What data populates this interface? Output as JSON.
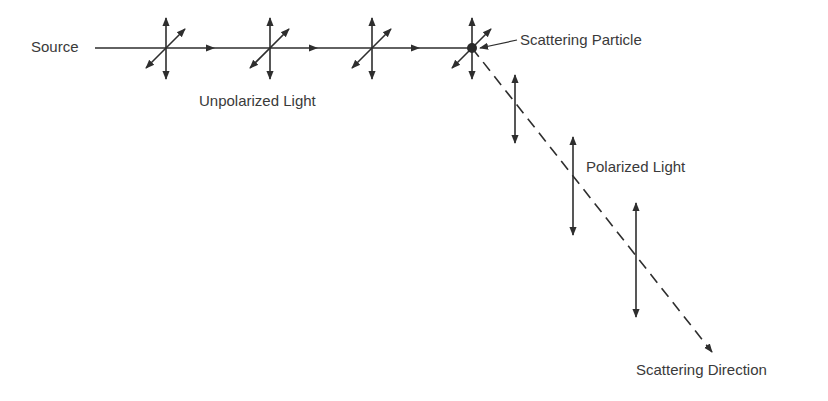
{
  "diagram": {
    "labels": {
      "source": "Source",
      "unpolarized": "Unpolarized Light",
      "particle": "Scattering Particle",
      "polarized": "Polarized Light",
      "direction": "Scattering Direction"
    },
    "colors": {
      "ink": "#2e2e2e",
      "text": "#3a3a3a",
      "background": "#ffffff"
    },
    "beam": {
      "y": 48,
      "x_start": 95,
      "x_end": 472,
      "arrow_x": [
        215,
        318,
        420
      ]
    },
    "unpolarized_crosses_x": [
      166,
      270,
      372,
      472
    ],
    "particle": {
      "x": 472,
      "y": 48
    },
    "scattered_ray": {
      "from": [
        472,
        48
      ],
      "to": [
        712,
        352
      ],
      "style": "dashed"
    },
    "polarized_vectors": [
      {
        "x": 515,
        "y1": 75,
        "y2": 143
      },
      {
        "x": 573,
        "y1": 137,
        "y2": 235
      },
      {
        "x": 636,
        "y1": 203,
        "y2": 317
      }
    ]
  }
}
